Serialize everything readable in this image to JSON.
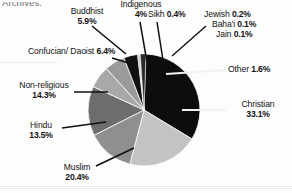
{
  "page": {
    "cut_off_text": "Archives."
  },
  "chart_data": {
    "type": "pie",
    "title": "",
    "xlabel": "",
    "ylabel": "",
    "legend_position": "callout-labels",
    "grid": false,
    "total": 100,
    "units": "percent",
    "categories": [
      "Christian",
      "Muslim",
      "Non-religious",
      "Hindu",
      "Confucian/ Daoist",
      "Buddhist",
      "Indigenous",
      "Other",
      "Sikh",
      "Jewish",
      "Baha'i",
      "Jain"
    ],
    "values": [
      33.1,
      20.4,
      14.3,
      13.5,
      6.4,
      5.9,
      4,
      1.6,
      0.4,
      0.2,
      0.1,
      0.1
    ],
    "slices": [
      {
        "name": "Christian",
        "label": "Christian",
        "value_text": "33.1%",
        "value": 33.1,
        "color": "#0d0d0d"
      },
      {
        "name": "Muslim",
        "label": "Muslim",
        "value_text": "20.4%",
        "value": 20.4,
        "color": "#c3c3c3"
      },
      {
        "name": "Non-religious",
        "label": "Non-religious",
        "value_text": "14.3%",
        "value": 14.3,
        "color": "#6d6d6d"
      },
      {
        "name": "Hindu",
        "label": "Hindu",
        "value_text": "13.5%",
        "value": 13.5,
        "color": "#8f8f8f"
      },
      {
        "name": "Confucian/Daoist",
        "label": "Confucian/ Daoist",
        "value_text": "6.4%",
        "value": 6.4,
        "color": "#a8a8a8"
      },
      {
        "name": "Buddhist",
        "label": "Buddhist",
        "value_text": "5.9%",
        "value": 5.9,
        "color": "#9a9a9a"
      },
      {
        "name": "Indigenous",
        "label": "Indigenous",
        "value_text": "4%",
        "value": 4,
        "color": "#111111"
      },
      {
        "name": "Sikh",
        "label": "Sikh",
        "value_text": "0.4%",
        "value": 0.4,
        "color": "#bdbdbd"
      },
      {
        "name": "Jewish",
        "label": "Jewish",
        "value_text": "0.2%",
        "value": 0.2,
        "color": "#6a6a6a"
      },
      {
        "name": "Bahai",
        "label": "Baha'i",
        "value_text": "0.1%",
        "value": 0.1,
        "color": "#9d9d9d"
      },
      {
        "name": "Jain",
        "label": "Jain",
        "value_text": "0.1%",
        "value": 0.1,
        "color": "#7b7b7b"
      },
      {
        "name": "Other",
        "label": "Other",
        "value_text": "1.6%",
        "value": 1.6,
        "color": "#2b2b2b"
      }
    ]
  }
}
